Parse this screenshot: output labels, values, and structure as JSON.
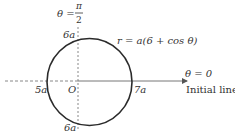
{
  "diagram": {
    "type": "polar-curve",
    "curve_equation": "r = a(6 + cos θ)",
    "vertical_axis_label": {
      "lhs": "θ =",
      "num": "π",
      "den": "2"
    },
    "initial_line_angle_label": "θ = 0",
    "initial_line_label": "Initial line",
    "pole_label": "O",
    "intercepts": {
      "top": "6a",
      "bottom": "6a",
      "left": "5a",
      "right": "7a"
    },
    "colors": {
      "curve": "#2b2b2b",
      "axis": "#888888",
      "text": "#333333",
      "background": "#ffffff"
    }
  }
}
